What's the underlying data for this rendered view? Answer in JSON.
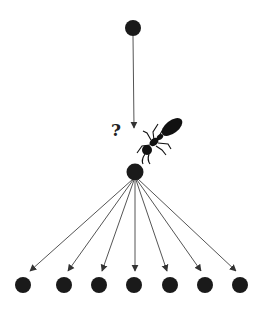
{
  "diagram": {
    "title": "",
    "question_label": "?",
    "colors": {
      "node": "#1a1a1a",
      "edge": "#555555",
      "ant": "#111111",
      "background": "#ffffff"
    },
    "nodes": {
      "source": {
        "x": 133,
        "y": 28,
        "r": 8
      },
      "hub": {
        "x": 135,
        "y": 172,
        "r": 8.5
      },
      "leaves": [
        {
          "x": 23,
          "y": 285,
          "r": 8
        },
        {
          "x": 64,
          "y": 285,
          "r": 8
        },
        {
          "x": 99,
          "y": 285,
          "r": 8
        },
        {
          "x": 134,
          "y": 285,
          "r": 8
        },
        {
          "x": 170,
          "y": 285,
          "r": 8
        },
        {
          "x": 205,
          "y": 285,
          "r": 8
        },
        {
          "x": 240,
          "y": 285,
          "r": 8
        }
      ]
    },
    "edges": [
      {
        "from": "source",
        "to": "hub-approach",
        "x1": 133,
        "y1": 36,
        "x2": 134,
        "y2": 128
      },
      {
        "from": "hub",
        "to": "leaf-1",
        "x1": 133,
        "y1": 179,
        "x2": 30,
        "y2": 271
      },
      {
        "from": "hub",
        "to": "leaf-2",
        "x1": 133,
        "y1": 180,
        "x2": 68,
        "y2": 271
      },
      {
        "from": "hub",
        "to": "leaf-3",
        "x1": 134,
        "y1": 180,
        "x2": 102,
        "y2": 271
      },
      {
        "from": "hub",
        "to": "leaf-4",
        "x1": 135,
        "y1": 181,
        "x2": 135,
        "y2": 271
      },
      {
        "from": "hub",
        "to": "leaf-5",
        "x1": 136,
        "y1": 180,
        "x2": 167,
        "y2": 271
      },
      {
        "from": "hub",
        "to": "leaf-6",
        "x1": 137,
        "y1": 180,
        "x2": 201,
        "y2": 271
      },
      {
        "from": "hub",
        "to": "leaf-7",
        "x1": 138,
        "y1": 179,
        "x2": 236,
        "y2": 271
      }
    ],
    "ant": {
      "icon": "ant-icon",
      "x": 160,
      "y": 138
    }
  }
}
